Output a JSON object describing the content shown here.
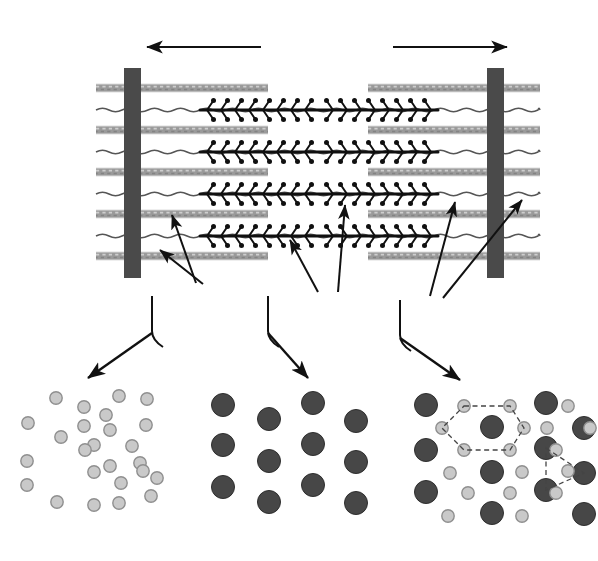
{
  "colors": {
    "background": "#ffffff",
    "ink": "#111111",
    "z_line": "#4a4a4a",
    "actin_filament": "#9a9a9a",
    "actin_filament_light": "#c2c2c2",
    "titin_line": "#555555",
    "myosin_filament": "#101010",
    "actin_circle_fill": "#c9c9c9",
    "actin_circle_stroke": "#8f8f8f",
    "myosin_circle_fill": "#474747",
    "myosin_circle_stroke": "#2e2e2e",
    "dashed_overlay": "#444444"
  },
  "scale_arrow": {
    "label": "Sarcomere",
    "left_x": 138,
    "right_x": 516,
    "y": 47,
    "double_headed": true
  },
  "labels": [
    {
      "id": "z-line-left",
      "text": "Z line",
      "x": 107,
      "y": 318,
      "anchor": "middle"
    },
    {
      "id": "actin",
      "text": "Actin",
      "x": 208,
      "y": 327,
      "anchor": "middle"
    },
    {
      "id": "myosin",
      "text": "Myosin",
      "x": 331,
      "y": 320,
      "anchor": "middle"
    },
    {
      "id": "titin",
      "text": "Titin",
      "x": 432,
      "y": 325,
      "anchor": "middle"
    },
    {
      "id": "z-line-right",
      "text": "Z line",
      "x": 515,
      "y": 318,
      "anchor": "middle"
    }
  ],
  "z_lines": [
    {
      "id": "z-left",
      "x": 124,
      "y": 68,
      "width": 17,
      "height": 210
    },
    {
      "id": "z-right",
      "x": 487,
      "y": 68,
      "width": 17,
      "height": 210
    }
  ],
  "actin_rows": {
    "count": 5,
    "y_positions": [
      88,
      130,
      172,
      214,
      256
    ],
    "thickness": 7,
    "left_segment": {
      "x_start": 96,
      "x_end": 268
    },
    "right_segment": {
      "x_start": 368,
      "x_end": 540
    }
  },
  "titin_rows": {
    "count": 4,
    "y_positions": [
      110,
      152,
      194,
      236
    ],
    "x_start": 96,
    "x_end": 540
  },
  "myosin_rows": {
    "count": 4,
    "y_positions": [
      110,
      152,
      194,
      236
    ],
    "x_start": 200,
    "x_end": 438,
    "bare_zone_center": 319,
    "head_spacing": 14
  },
  "panels": [
    {
      "id": "actin-lattice",
      "name": "actin-cross-section",
      "x": 22,
      "y": 388,
      "width": 150,
      "height": 160,
      "actin_circles": [
        [
          34,
          10
        ],
        [
          62,
          19
        ],
        [
          97,
          8
        ],
        [
          125,
          11
        ],
        [
          6,
          35
        ],
        [
          62,
          38
        ],
        [
          84,
          27
        ],
        [
          124,
          37
        ],
        [
          39,
          49
        ],
        [
          72,
          57
        ],
        [
          88,
          42
        ],
        [
          110,
          58
        ],
        [
          5,
          73
        ],
        [
          63,
          62
        ],
        [
          88,
          78
        ],
        [
          118,
          75
        ],
        [
          72,
          84
        ],
        [
          121,
          83
        ],
        [
          5,
          97
        ],
        [
          99,
          95
        ],
        [
          135,
          90
        ],
        [
          35,
          114
        ],
        [
          72,
          117
        ],
        [
          97,
          115
        ],
        [
          129,
          108
        ]
      ],
      "myosin_circles": []
    },
    {
      "id": "myosin-lattice",
      "name": "myosin-cross-section",
      "x": 205,
      "y": 388,
      "width": 160,
      "height": 160,
      "actin_circles": [],
      "myosin_circles": [
        [
          18,
          17
        ],
        [
          64,
          31
        ],
        [
          108,
          15
        ],
        [
          151,
          33
        ],
        [
          18,
          57
        ],
        [
          64,
          73
        ],
        [
          108,
          56
        ],
        [
          151,
          74
        ],
        [
          18,
          99
        ],
        [
          64,
          114
        ],
        [
          108,
          97
        ],
        [
          151,
          115
        ]
      ]
    },
    {
      "id": "combined-lattice",
      "name": "combined-cross-section",
      "x": 412,
      "y": 388,
      "width": 172,
      "height": 162,
      "myosin_circles": [
        [
          14,
          17
        ],
        [
          80,
          39
        ],
        [
          134,
          15
        ],
        [
          172,
          40
        ],
        [
          14,
          62
        ],
        [
          80,
          84
        ],
        [
          134,
          60
        ],
        [
          172,
          85
        ],
        [
          14,
          104
        ],
        [
          80,
          125
        ],
        [
          134,
          102
        ],
        [
          172,
          126
        ]
      ],
      "actin_circles": [
        [
          52,
          18
        ],
        [
          98,
          18
        ],
        [
          30,
          40
        ],
        [
          112,
          40
        ],
        [
          52,
          62
        ],
        [
          98,
          62
        ],
        [
          156,
          18
        ],
        [
          135,
          40
        ],
        [
          178,
          40
        ],
        [
          38,
          85
        ],
        [
          110,
          84
        ],
        [
          144,
          62
        ],
        [
          56,
          105
        ],
        [
          98,
          105
        ],
        [
          156,
          83
        ],
        [
          36,
          128
        ],
        [
          110,
          128
        ],
        [
          144,
          105
        ]
      ],
      "hexagon_overlay": {
        "enabled": true,
        "vertices": [
          [
            52,
            18
          ],
          [
            98,
            18
          ],
          [
            112,
            40
          ],
          [
            98,
            62
          ],
          [
            52,
            62
          ],
          [
            30,
            40
          ]
        ],
        "center": [
          80,
          39
        ]
      },
      "triangle_overlay": {
        "enabled": true,
        "vertices": [
          [
            134,
            60
          ],
          [
            172,
            85
          ],
          [
            134,
            102
          ]
        ]
      }
    }
  ],
  "leader_arrows": [
    {
      "id": "actin-arrow-1",
      "from": [
        196,
        283
      ],
      "to": [
        172,
        215
      ]
    },
    {
      "id": "actin-arrow-2",
      "from": [
        203,
        284
      ],
      "to": [
        160,
        250
      ]
    },
    {
      "id": "myosin-arrow-1",
      "from": [
        318,
        292
      ],
      "to": [
        290,
        240
      ]
    },
    {
      "id": "myosin-arrow-2",
      "from": [
        338,
        292
      ],
      "to": [
        345,
        205
      ]
    },
    {
      "id": "titin-arrow-1",
      "from": [
        430,
        296
      ],
      "to": [
        455,
        202
      ]
    },
    {
      "id": "titin-arrow-2",
      "from": [
        443,
        298
      ],
      "to": [
        522,
        200
      ]
    }
  ],
  "panel_arrows": [
    {
      "id": "arrow-to-actin-panel",
      "from": [
        152,
        333
      ],
      "to": [
        88,
        378
      ]
    },
    {
      "id": "arrow-to-myosin-panel",
      "from": [
        268,
        333
      ],
      "to": [
        308,
        378
      ]
    },
    {
      "id": "arrow-to-combined-panel",
      "from": [
        400,
        338
      ],
      "to": [
        460,
        380
      ]
    }
  ],
  "brackets": [
    {
      "id": "bracket-z-line-left",
      "x": 152,
      "y_top": 296,
      "y_bottom": 340,
      "side": "left"
    },
    {
      "id": "bracket-myosin",
      "x": 268,
      "y_top": 296,
      "y_bottom": 340,
      "side": "left"
    },
    {
      "id": "bracket-titin",
      "x": 400,
      "y_top": 300,
      "y_bottom": 344,
      "side": "left"
    }
  ]
}
